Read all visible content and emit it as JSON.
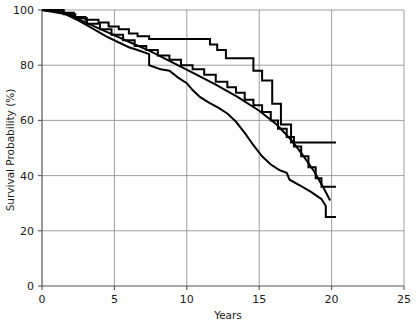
{
  "chart_data": {
    "type": "line",
    "title": "",
    "subtitle": "",
    "xlabel": "Years",
    "ylabel": "Survival Probability (%)",
    "xlim": [
      0,
      25
    ],
    "ylim": [
      0,
      100
    ],
    "xticks": [
      0,
      5,
      10,
      15,
      20,
      25
    ],
    "xtick_labels": [
      "0",
      "5",
      "10",
      "15",
      "20",
      "25"
    ],
    "yticks": [
      0,
      20,
      40,
      60,
      80,
      100
    ],
    "ytick_labels": [
      "0",
      "20",
      "40",
      "60",
      "80",
      "100"
    ],
    "grid": true,
    "grid_color": "#888888",
    "axis_color": "#555555",
    "line_color": "#000000",
    "legend_position": "right-inline-endpoints",
    "annotations": [
      {
        "name": "A",
        "label_x": 21.1,
        "label_y": 51.0
      },
      {
        "name": "B",
        "label_x": 21.1,
        "label_y": 34.0
      },
      {
        "name": "C",
        "label_x": 21.1,
        "label_y": 27.5
      },
      {
        "name": "D",
        "label_x": 21.1,
        "label_y": 23.5
      }
    ],
    "series": [
      {
        "name": "A",
        "label": "A",
        "style": "step",
        "end_value": 52,
        "points": [
          [
            0.0,
            100
          ],
          [
            1.4,
            100
          ],
          [
            1.4,
            99
          ],
          [
            2.2,
            99
          ],
          [
            2.2,
            97.5
          ],
          [
            3.0,
            97.5
          ],
          [
            3.0,
            96.5
          ],
          [
            3.9,
            96.5
          ],
          [
            3.9,
            95.5
          ],
          [
            4.6,
            95.5
          ],
          [
            4.6,
            94.0
          ],
          [
            5.3,
            94.0
          ],
          [
            5.3,
            93.0
          ],
          [
            6.0,
            93.0
          ],
          [
            6.0,
            91.5
          ],
          [
            6.6,
            91.5
          ],
          [
            6.6,
            90.5
          ],
          [
            7.4,
            90.5
          ],
          [
            7.4,
            89.5
          ],
          [
            11.6,
            89.5
          ],
          [
            11.6,
            87.5
          ],
          [
            12.1,
            87.5
          ],
          [
            12.1,
            85.5
          ],
          [
            12.7,
            85.5
          ],
          [
            12.7,
            82.5
          ],
          [
            14.6,
            82.5
          ],
          [
            14.6,
            78.0
          ],
          [
            15.2,
            78.0
          ],
          [
            15.2,
            74.5
          ],
          [
            15.9,
            74.5
          ],
          [
            15.9,
            66.0
          ],
          [
            16.5,
            66.0
          ],
          [
            16.5,
            58.5
          ],
          [
            17.2,
            58.5
          ],
          [
            17.2,
            52.0
          ],
          [
            20.3,
            52.0
          ]
        ]
      },
      {
        "name": "B",
        "label": "B",
        "style": "step",
        "end_value": 36,
        "points": [
          [
            0.0,
            100
          ],
          [
            1.5,
            100
          ],
          [
            1.5,
            98.5
          ],
          [
            2.3,
            98.5
          ],
          [
            2.3,
            97.0
          ],
          [
            3.1,
            97.0
          ],
          [
            3.1,
            95.0
          ],
          [
            4.0,
            95.0
          ],
          [
            4.0,
            93.0
          ],
          [
            4.8,
            93.0
          ],
          [
            4.8,
            91.0
          ],
          [
            5.6,
            91.0
          ],
          [
            5.6,
            89.0
          ],
          [
            6.4,
            89.0
          ],
          [
            6.4,
            87.0
          ],
          [
            7.2,
            87.0
          ],
          [
            7.2,
            85.5
          ],
          [
            8.0,
            85.5
          ],
          [
            8.0,
            83.5
          ],
          [
            8.8,
            83.5
          ],
          [
            8.8,
            82.0
          ],
          [
            9.6,
            82.0
          ],
          [
            9.6,
            80.0
          ],
          [
            10.4,
            80.0
          ],
          [
            10.4,
            78.5
          ],
          [
            11.2,
            78.5
          ],
          [
            11.2,
            76.5
          ],
          [
            12.0,
            76.5
          ],
          [
            12.0,
            74.0
          ],
          [
            12.8,
            74.0
          ],
          [
            12.8,
            72.0
          ],
          [
            13.4,
            72.0
          ],
          [
            13.4,
            70.0
          ],
          [
            14.0,
            70.0
          ],
          [
            14.0,
            67.5
          ],
          [
            14.6,
            67.5
          ],
          [
            14.6,
            65.5
          ],
          [
            15.2,
            65.5
          ],
          [
            15.2,
            63.0
          ],
          [
            15.8,
            63.0
          ],
          [
            15.8,
            60.0
          ],
          [
            16.3,
            60.0
          ],
          [
            16.3,
            57.0
          ],
          [
            16.9,
            57.0
          ],
          [
            16.9,
            54.0
          ],
          [
            17.4,
            54.0
          ],
          [
            17.4,
            50.5
          ],
          [
            17.9,
            50.5
          ],
          [
            17.9,
            47.0
          ],
          [
            18.4,
            47.0
          ],
          [
            18.4,
            43.0
          ],
          [
            18.9,
            43.0
          ],
          [
            18.9,
            39.0
          ],
          [
            19.3,
            39.0
          ],
          [
            19.3,
            36.0
          ],
          [
            20.3,
            36.0
          ]
        ]
      },
      {
        "name": "C",
        "label": "C",
        "style": "smooth",
        "end_value": 31,
        "points": [
          [
            0.0,
            100
          ],
          [
            1.6,
            99.0
          ],
          [
            3.0,
            95.5
          ],
          [
            4.5,
            92.0
          ],
          [
            6.0,
            88.5
          ],
          [
            7.5,
            85.0
          ],
          [
            9.0,
            81.0
          ],
          [
            10.5,
            77.0
          ],
          [
            12.0,
            73.0
          ],
          [
            13.5,
            68.5
          ],
          [
            15.0,
            63.5
          ],
          [
            16.2,
            58.5
          ],
          [
            17.2,
            53.0
          ],
          [
            18.0,
            47.5
          ],
          [
            18.8,
            41.5
          ],
          [
            19.4,
            36.0
          ],
          [
            19.9,
            31.0
          ]
        ]
      },
      {
        "name": "D",
        "label": "D",
        "style": "smooth",
        "end_value": 25,
        "points": [
          [
            0.0,
            100
          ],
          [
            1.6,
            98.5
          ],
          [
            2.6,
            96.0
          ],
          [
            3.6,
            93.0
          ],
          [
            4.4,
            90.5
          ],
          [
            5.2,
            88.5
          ],
          [
            6.0,
            86.5
          ],
          [
            6.6,
            85.5
          ],
          [
            7.4,
            84.0
          ],
          [
            7.4,
            80.0
          ],
          [
            8.2,
            78.5
          ],
          [
            8.8,
            78.0
          ],
          [
            9.4,
            75.5
          ],
          [
            10.0,
            73.5
          ],
          [
            10.4,
            71.0
          ],
          [
            10.9,
            68.5
          ],
          [
            11.5,
            66.5
          ],
          [
            12.2,
            64.5
          ],
          [
            12.8,
            62.5
          ],
          [
            13.4,
            59.5
          ],
          [
            14.0,
            55.5
          ],
          [
            14.6,
            51.0
          ],
          [
            15.2,
            47.0
          ],
          [
            15.8,
            44.0
          ],
          [
            16.4,
            42.0
          ],
          [
            16.9,
            41.0
          ],
          [
            17.1,
            38.5
          ],
          [
            17.8,
            36.5
          ],
          [
            18.6,
            34.0
          ],
          [
            19.3,
            31.5
          ],
          [
            19.6,
            29.0
          ],
          [
            19.6,
            25.0
          ],
          [
            20.3,
            25.0
          ]
        ]
      }
    ]
  }
}
